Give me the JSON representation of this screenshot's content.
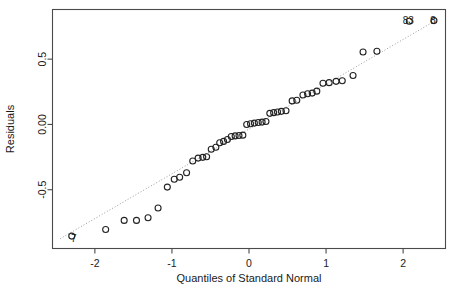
{
  "chart_data": {
    "type": "scatter",
    "title": "",
    "xlabel": "Quantiles of Standard Normal",
    "ylabel": "Residuals",
    "xlim": [
      -2.55,
      2.55
    ],
    "ylim": [
      -0.95,
      0.88
    ],
    "xticks": [
      -2,
      -1,
      0,
      1,
      2
    ],
    "xtick_labels": [
      "-2",
      "-1",
      "0",
      "1",
      "2"
    ],
    "yticks": [
      -0.5,
      0.0,
      0.5
    ],
    "ytick_labels": [
      "-0.5",
      "0.00",
      "0.5"
    ],
    "grid": false,
    "legend": "none",
    "reference_line": {
      "style": "dotted",
      "color": "#8f8f8f",
      "x": [
        -2.45,
        2.45
      ],
      "y": [
        -0.875,
        0.805
      ]
    },
    "marker": {
      "shape": "open-circle",
      "color": "#222222",
      "radius": 3.0
    },
    "points": [
      {
        "x": -2.3,
        "y": -0.855,
        "label": "7"
      },
      {
        "x": -1.86,
        "y": -0.805,
        "label": ""
      },
      {
        "x": -1.62,
        "y": -0.735,
        "label": ""
      },
      {
        "x": -1.46,
        "y": -0.735,
        "label": ""
      },
      {
        "x": -1.31,
        "y": -0.715,
        "label": ""
      },
      {
        "x": -1.18,
        "y": -0.64,
        "label": ""
      },
      {
        "x": -1.06,
        "y": -0.48,
        "label": ""
      },
      {
        "x": -0.97,
        "y": -0.42,
        "label": ""
      },
      {
        "x": -0.9,
        "y": -0.405,
        "label": ""
      },
      {
        "x": -0.81,
        "y": -0.37,
        "label": ""
      },
      {
        "x": -0.73,
        "y": -0.28,
        "label": ""
      },
      {
        "x": -0.66,
        "y": -0.258,
        "label": ""
      },
      {
        "x": -0.6,
        "y": -0.252,
        "label": ""
      },
      {
        "x": -0.55,
        "y": -0.248,
        "label": ""
      },
      {
        "x": -0.49,
        "y": -0.19,
        "label": ""
      },
      {
        "x": -0.43,
        "y": -0.175,
        "label": ""
      },
      {
        "x": -0.38,
        "y": -0.14,
        "label": ""
      },
      {
        "x": -0.33,
        "y": -0.13,
        "label": ""
      },
      {
        "x": -0.28,
        "y": -0.115,
        "label": ""
      },
      {
        "x": -0.23,
        "y": -0.092,
        "label": ""
      },
      {
        "x": -0.18,
        "y": -0.088,
        "label": ""
      },
      {
        "x": -0.13,
        "y": -0.085,
        "label": ""
      },
      {
        "x": -0.08,
        "y": -0.082,
        "label": ""
      },
      {
        "x": -0.03,
        "y": 0.0,
        "label": ""
      },
      {
        "x": 0.02,
        "y": 0.005,
        "label": ""
      },
      {
        "x": 0.07,
        "y": 0.01,
        "label": ""
      },
      {
        "x": 0.12,
        "y": 0.015,
        "label": ""
      },
      {
        "x": 0.17,
        "y": 0.018,
        "label": ""
      },
      {
        "x": 0.22,
        "y": 0.022,
        "label": ""
      },
      {
        "x": 0.27,
        "y": 0.085,
        "label": ""
      },
      {
        "x": 0.32,
        "y": 0.09,
        "label": ""
      },
      {
        "x": 0.37,
        "y": 0.095,
        "label": ""
      },
      {
        "x": 0.42,
        "y": 0.1,
        "label": ""
      },
      {
        "x": 0.48,
        "y": 0.105,
        "label": ""
      },
      {
        "x": 0.56,
        "y": 0.18,
        "label": ""
      },
      {
        "x": 0.62,
        "y": 0.185,
        "label": ""
      },
      {
        "x": 0.7,
        "y": 0.225,
        "label": ""
      },
      {
        "x": 0.76,
        "y": 0.235,
        "label": ""
      },
      {
        "x": 0.82,
        "y": 0.24,
        "label": ""
      },
      {
        "x": 0.88,
        "y": 0.255,
        "label": ""
      },
      {
        "x": 0.96,
        "y": 0.315,
        "label": ""
      },
      {
        "x": 1.04,
        "y": 0.32,
        "label": ""
      },
      {
        "x": 1.13,
        "y": 0.33,
        "label": ""
      },
      {
        "x": 1.21,
        "y": 0.335,
        "label": ""
      },
      {
        "x": 1.35,
        "y": 0.375,
        "label": ""
      },
      {
        "x": 1.48,
        "y": 0.555,
        "label": ""
      },
      {
        "x": 1.66,
        "y": 0.56,
        "label": ""
      },
      {
        "x": 2.08,
        "y": 0.79,
        "label": "83"
      },
      {
        "x": 2.4,
        "y": 0.795,
        "label": "8"
      }
    ],
    "annotations": [
      {
        "text": "7",
        "x": -2.3,
        "y": -0.855,
        "position": "left"
      },
      {
        "text": "83",
        "x": 2.08,
        "y": 0.79,
        "position": "right"
      },
      {
        "text": "8",
        "x": 2.4,
        "y": 0.795,
        "position": "right"
      }
    ]
  }
}
